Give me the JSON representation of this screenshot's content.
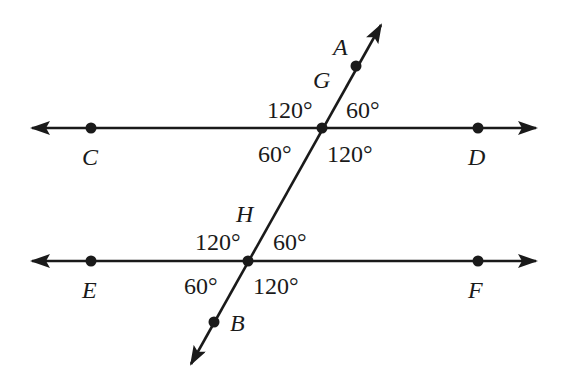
{
  "diagram": {
    "type": "parallel-lines-cut-by-transversal",
    "colors": {
      "line": "#1a1a1a",
      "background": "#ffffff"
    },
    "lines": [
      {
        "id": "line-CD",
        "label": "Line CD",
        "from": [
          32,
          128
        ],
        "to": [
          536,
          128
        ],
        "arrows": "both"
      },
      {
        "id": "line-EF",
        "label": "Line EF",
        "from": [
          32,
          261
        ],
        "to": [
          536,
          261
        ],
        "arrows": "both"
      },
      {
        "id": "transversal-AB",
        "label": "Transversal AB",
        "from": [
          191,
          364
        ],
        "to": [
          381,
          25
        ],
        "arrows": "both"
      }
    ],
    "points": [
      {
        "name": "A",
        "x": 356,
        "y": 66
      },
      {
        "name": "G",
        "x": 322,
        "y": 128
      },
      {
        "name": "C",
        "x": 91,
        "y": 128
      },
      {
        "name": "D",
        "x": 478,
        "y": 128
      },
      {
        "name": "H",
        "x": 248,
        "y": 261
      },
      {
        "name": "E",
        "x": 91,
        "y": 261
      },
      {
        "name": "F",
        "x": 478,
        "y": 261
      },
      {
        "name": "B",
        "x": 214,
        "y": 322
      }
    ],
    "point_labels": [
      {
        "text": "A",
        "x": 333,
        "y": 55
      },
      {
        "text": "G",
        "x": 313,
        "y": 88
      },
      {
        "text": "C",
        "x": 82,
        "y": 165
      },
      {
        "text": "D",
        "x": 468,
        "y": 165
      },
      {
        "text": "H",
        "x": 236,
        "y": 222
      },
      {
        "text": "E",
        "x": 82,
        "y": 298
      },
      {
        "text": "F",
        "x": 468,
        "y": 298
      },
      {
        "text": "B",
        "x": 230,
        "y": 331
      }
    ],
    "angles": [
      {
        "vertex": "G",
        "position": "upper-left",
        "text": "120°",
        "x": 267,
        "y": 118
      },
      {
        "vertex": "G",
        "position": "upper-right",
        "text": "60°",
        "x": 346,
        "y": 118
      },
      {
        "vertex": "G",
        "position": "lower-left",
        "text": "60°",
        "x": 258,
        "y": 162
      },
      {
        "vertex": "G",
        "position": "lower-right",
        "text": "120°",
        "x": 327,
        "y": 162
      },
      {
        "vertex": "H",
        "position": "upper-left",
        "text": "120°",
        "x": 195,
        "y": 250
      },
      {
        "vertex": "H",
        "position": "upper-right",
        "text": "60°",
        "x": 273,
        "y": 250
      },
      {
        "vertex": "H",
        "position": "lower-left",
        "text": "60°",
        "x": 184,
        "y": 294
      },
      {
        "vertex": "H",
        "position": "lower-right",
        "text": "120°",
        "x": 253,
        "y": 294
      }
    ]
  }
}
